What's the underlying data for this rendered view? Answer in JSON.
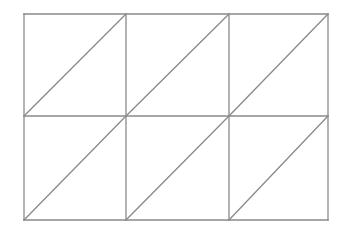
{
  "diagram": {
    "type": "triangulated-grid",
    "columns": 3,
    "rows": 2,
    "x_lines": [
      24,
      126,
      229,
      328
    ],
    "y_lines": [
      14,
      116,
      220
    ],
    "diagonal_direction": "bottom-left-to-top-right",
    "stroke_color": "#8a8a8a",
    "stroke_width": 1.3,
    "background": "#ffffff"
  }
}
